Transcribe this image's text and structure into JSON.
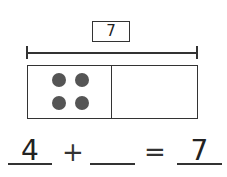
{
  "diagram": {
    "total": "7",
    "parts": [
      {
        "label": "part-1",
        "dots": 4
      },
      {
        "label": "part-2",
        "dots": 0
      }
    ],
    "dot_color": "#555555"
  },
  "equation": {
    "addend1": "4",
    "plus": "+",
    "addend2": "",
    "equals": "=",
    "sum": "7"
  }
}
